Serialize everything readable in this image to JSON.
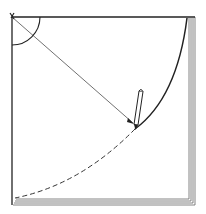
{
  "figure": {
    "caption_partial": "",
    "elements": {
      "pin_corner": {
        "x": 12,
        "y": 17
      },
      "corner_angle_arc_radius": 28,
      "string_end": {
        "x": 133,
        "y": 123
      },
      "pencil": {
        "top": {
          "x": 141,
          "y": 91
        },
        "tip": {
          "x": 135,
          "y": 129
        }
      },
      "drawn_arc": "solid from top-right corner to pencil tip",
      "remaining_arc": "dashed from pencil tip to bottom-left corner"
    },
    "colors": {
      "ink": "#222222",
      "paper": "#ffffff",
      "stack_shade": "#9a9a9a"
    }
  }
}
